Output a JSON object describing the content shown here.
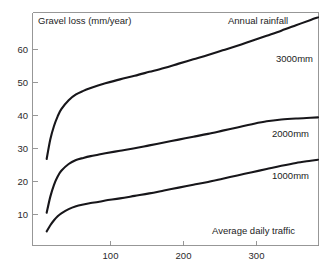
{
  "chart_data": {
    "type": "line",
    "title": "Annual rainfall",
    "xlabel": "Average daily traffic",
    "ylabel": "Gravel loss (mm/year)",
    "xlim": [
      0,
      390
    ],
    "ylim": [
      5,
      70
    ],
    "xticks": [
      100,
      200,
      300
    ],
    "xtick_labels": [
      "100",
      "200",
      "300"
    ],
    "yticks": [
      10,
      20,
      30,
      40,
      50,
      60
    ],
    "ytick_labels": [
      "10",
      "20",
      "30",
      "40",
      "50",
      "60"
    ],
    "grid": false,
    "legend_position": "inline-right-of-curve",
    "line_color": "#17161a",
    "axis_color": "#8c8c8c",
    "background_color": "#ffffff",
    "series": [
      {
        "name": "3000mm",
        "label": "3000mm",
        "x": [
          20,
          25,
          30,
          35,
          40,
          50,
          60,
          70,
          80,
          90,
          100,
          120,
          140,
          160,
          180,
          200,
          220,
          240,
          260,
          280,
          300,
          320,
          340,
          360,
          380,
          390
        ],
        "values": [
          29.0,
          34.5,
          38.2,
          40.9,
          42.9,
          45.4,
          47.0,
          48.0,
          48.8,
          49.5,
          50.1,
          51.2,
          52.2,
          53.3,
          54.4,
          55.6,
          56.8,
          58.0,
          59.3,
          60.6,
          62.0,
          63.4,
          64.8,
          66.3,
          67.8,
          68.5
        ]
      },
      {
        "name": "2000mm",
        "label": "2000mm",
        "x": [
          20,
          25,
          30,
          35,
          40,
          50,
          60,
          70,
          80,
          90,
          100,
          120,
          140,
          160,
          180,
          200,
          220,
          240,
          260,
          280,
          300,
          320,
          340,
          360,
          380,
          390
        ],
        "values": [
          14.0,
          18.5,
          21.8,
          24.1,
          25.7,
          27.6,
          28.7,
          29.3,
          29.8,
          30.2,
          30.6,
          31.3,
          32.0,
          32.8,
          33.6,
          34.4,
          35.2,
          36.0,
          36.9,
          37.8,
          38.7,
          39.5,
          40.0,
          40.3,
          40.5,
          40.6
        ]
      },
      {
        "name": "1000mm",
        "label": "1000mm",
        "x": [
          20,
          25,
          30,
          35,
          40,
          50,
          60,
          70,
          80,
          90,
          100,
          120,
          140,
          160,
          180,
          200,
          220,
          240,
          260,
          280,
          300,
          320,
          340,
          360,
          380,
          390
        ],
        "values": [
          8.8,
          10.5,
          11.9,
          13.0,
          13.8,
          15.0,
          15.8,
          16.3,
          16.7,
          17.0,
          17.4,
          18.0,
          18.7,
          19.4,
          20.2,
          21.0,
          21.8,
          22.6,
          23.5,
          24.4,
          25.3,
          26.2,
          27.1,
          27.9,
          28.5,
          28.8
        ]
      }
    ],
    "series_label_positions": [
      {
        "label": "3000mm",
        "x": 296,
        "y": 59
      },
      {
        "label": "2000mm",
        "x": 292,
        "y": 134
      },
      {
        "label": "1000mm",
        "x": 292,
        "y": 176
      }
    ]
  },
  "layout": {
    "frame": {
      "left": 32,
      "right": 318,
      "top": 12,
      "bottom": 245
    },
    "title_position": {
      "x": 228,
      "y": 18
    },
    "ylabel_position": {
      "x": 38,
      "y": 18
    },
    "xlabel_position": {
      "x": 212,
      "y": 228
    }
  }
}
